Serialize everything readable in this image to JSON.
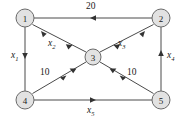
{
  "figure": {
    "width": 186,
    "height": 121,
    "background_color": "#ffffff",
    "node_fill_color": "#e2e2e2",
    "node_stroke_color": "#6a6a6a",
    "edge_color": "#4a4a4a"
  },
  "nodes": [
    {
      "id": "1",
      "label": "1",
      "x": 25,
      "y": 18,
      "r": 9
    },
    {
      "id": "2",
      "label": "2",
      "x": 161,
      "y": 18,
      "r": 9
    },
    {
      "id": "3",
      "label": "3",
      "x": 93,
      "y": 57,
      "r": 8
    },
    {
      "id": "4",
      "label": "4",
      "x": 25,
      "y": 100,
      "r": 9
    },
    {
      "id": "5",
      "label": "5",
      "x": 161,
      "y": 100,
      "r": 9
    }
  ],
  "edges": [
    {
      "id": "e-20",
      "from": "2",
      "to": "1",
      "label": "20",
      "label_kind": "number",
      "direction": "left"
    },
    {
      "id": "e-x1",
      "from": "1",
      "to": "4",
      "label": "x",
      "sub": "1",
      "label_kind": "variable",
      "direction": "down"
    },
    {
      "id": "e-x2",
      "from": "1",
      "to": "5",
      "label": "x",
      "sub": "2",
      "label_kind": "variable",
      "direction": "down-right",
      "via": "3"
    },
    {
      "id": "e-x3",
      "from": "2",
      "to": "4",
      "label": "x",
      "sub": "3",
      "label_kind": "variable",
      "direction": "down-left",
      "via": "3"
    },
    {
      "id": "e-x4",
      "from": "5",
      "to": "2",
      "label": "x",
      "sub": "4",
      "label_kind": "variable",
      "direction": "up"
    },
    {
      "id": "e-x5",
      "from": "4",
      "to": "5",
      "label": "x",
      "sub": "5",
      "label_kind": "variable",
      "direction": "right"
    },
    {
      "id": "e-10a",
      "from": "4",
      "to": "2",
      "label": "10",
      "label_kind": "number",
      "direction": "up-right",
      "via": "3"
    },
    {
      "id": "e-10b",
      "from": "5",
      "to": "1",
      "label": "10",
      "label_kind": "number",
      "direction": "up-left",
      "via": "3"
    }
  ],
  "edge_labels": [
    {
      "id": "lbl-20",
      "text": "20",
      "sub": "",
      "italic": false,
      "x": 86,
      "y": 2,
      "name": "edge-label-20"
    },
    {
      "id": "lbl-x1",
      "text": "x",
      "sub": "1",
      "italic": true,
      "x": 11,
      "y": 51,
      "name": "edge-label-x1"
    },
    {
      "id": "lbl-x2",
      "text": "x",
      "sub": "2",
      "italic": true,
      "x": 48,
      "y": 39,
      "name": "edge-label-x2"
    },
    {
      "id": "lbl-x3",
      "text": "x",
      "sub": "3",
      "italic": true,
      "x": 118,
      "y": 39,
      "name": "edge-label-x3"
    },
    {
      "id": "lbl-x4",
      "text": "x",
      "sub": "4",
      "italic": true,
      "x": 167,
      "y": 51,
      "name": "edge-label-x4"
    },
    {
      "id": "lbl-x5",
      "text": "x",
      "sub": "5",
      "italic": true,
      "x": 87,
      "y": 106,
      "name": "edge-label-x5"
    },
    {
      "id": "lbl-10a",
      "text": "10",
      "sub": "",
      "italic": false,
      "x": 40,
      "y": 68,
      "name": "edge-label-10-left"
    },
    {
      "id": "lbl-10b",
      "text": "10",
      "sub": "",
      "italic": false,
      "x": 127,
      "y": 68,
      "name": "edge-label-10-right"
    }
  ]
}
